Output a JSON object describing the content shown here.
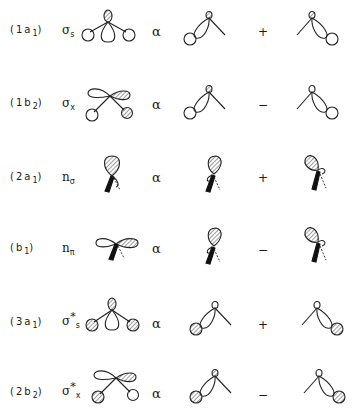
{
  "figure": {
    "relation_symbol": "α",
    "rows": [
      {
        "label": "(1a",
        "label_sub": "1",
        "label_end": ")",
        "orbital": "σ",
        "orbital_sub": "s",
        "orbital_sup": "",
        "sign": "+",
        "center_shape": "s-lone-plus-two-H-s",
        "left_combo": "p-lobe-H-left",
        "right_combo": "p-lobe-H-right"
      },
      {
        "label": "(1b",
        "label_sub": "2",
        "label_end": ")",
        "orbital": "σ",
        "orbital_sub": "x",
        "orbital_sup": "",
        "sign": "−",
        "center_shape": "px-plus-H-antisym",
        "left_combo": "p-lobe-H-left",
        "right_combo": "p-lobe-H-right"
      },
      {
        "label": "(2a",
        "label_sub": "1",
        "label_end": ")",
        "orbital": "n",
        "orbital_sub": "σ",
        "orbital_sup": "",
        "sign": "+",
        "center_shape": "lone-pair-sigma",
        "left_combo": "lone-pair-left",
        "right_combo": "lone-pair-right"
      },
      {
        "label": "(b",
        "label_sub": "1",
        "label_end": ")",
        "orbital": "n",
        "orbital_sub": "π",
        "orbital_sup": "",
        "sign": "−",
        "center_shape": "lone-pair-pi",
        "left_combo": "lone-pair-left",
        "right_combo": "lone-pair-right"
      },
      {
        "label": "(3a",
        "label_sub": "1",
        "label_end": ")",
        "orbital": "σ",
        "orbital_sub": "s",
        "orbital_sup": "*",
        "sign": "+",
        "center_shape": "s-antibonding",
        "left_combo": "p-lobe-H-left-hatched",
        "right_combo": "p-lobe-H-right-hatched"
      },
      {
        "label": "(2b",
        "label_sub": "2",
        "label_end": ")",
        "orbital": "σ",
        "orbital_sub": "x",
        "orbital_sup": "*",
        "sign": "−",
        "center_shape": "px-antibonding",
        "left_combo": "p-lobe-H-left-hatched",
        "right_combo": "p-lobe-H-right-hatched"
      }
    ]
  }
}
